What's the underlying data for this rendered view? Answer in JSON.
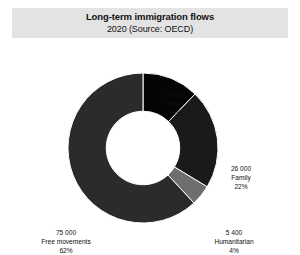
{
  "header": {
    "title": "Long-term immigration flows",
    "subtitle": "2020 (Source: OECD)"
  },
  "labels": {
    "work": {
      "value": "14 800",
      "name": "Work",
      "percent": "12%"
    },
    "family": {
      "value": "26 000",
      "name": "Family",
      "percent": "22%"
    },
    "humanitarian": {
      "value": "5 400",
      "name": "Humanitarian",
      "percent": "4%"
    },
    "free": {
      "value": "75 000",
      "name": "Free movements",
      "percent": "62%"
    }
  },
  "chart_data": {
    "type": "pie",
    "variant": "donut",
    "title": "Long-term immigration flows",
    "subtitle": "2020 (Source: OECD)",
    "categories": [
      "Work",
      "Family",
      "Humanitarian",
      "Free movements"
    ],
    "values": [
      14800,
      26000,
      5400,
      75000
    ],
    "percentages": [
      12,
      22,
      4,
      62
    ],
    "value_labels": [
      "14 800",
      "26 000",
      "5 400",
      "75 000"
    ],
    "percent_labels": [
      "12%",
      "22%",
      "4%",
      "62%"
    ],
    "colors": [
      "#050505",
      "#1a1a1a",
      "#6e6e6e",
      "#2b2b2b"
    ],
    "start_angle_deg": 0,
    "direction": "clockwise",
    "hole_ratio": 0.49,
    "legend": "none",
    "grid": false,
    "total": 121200,
    "unit": "persons",
    "source": "OECD"
  },
  "style": {
    "band_color": "#e3e3e3",
    "background": "#ffffff",
    "text_color": "#111111"
  }
}
